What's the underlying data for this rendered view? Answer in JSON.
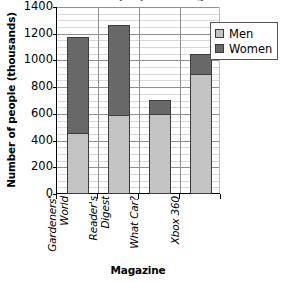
{
  "chart_data": {
    "type": "bar",
    "subtype": "stacked-vertical",
    "title": "Number of people reading magazines",
    "xlabel": "Magazine",
    "ylabel": "Number of people (thousands)",
    "ylim": [
      0,
      1400
    ],
    "ytick_step": 200,
    "yticks": [
      1400,
      1200,
      1000,
      800,
      600,
      400,
      200,
      0
    ],
    "ytick_labels": [
      "1400",
      "1200",
      "1000",
      "800",
      "600",
      "400",
      "200",
      "0"
    ],
    "minor_gridline_step": 50,
    "grid": "horizontal-major-and-minor-plus-vertical-category-separators",
    "legend_position": "right",
    "categories": [
      "Gardeners' World",
      "Reader's Digest",
      "What Car?",
      "Xbox 360"
    ],
    "category_labels_rotated": true,
    "series": [
      {
        "name": "Men",
        "color": "#c3c3c3",
        "values": [
          450,
          585,
          590,
          890
        ]
      },
      {
        "name": "Women",
        "color": "#686868",
        "values": [
          720,
          675,
          110,
          150
        ]
      }
    ],
    "totals": [
      1170,
      1260,
      700,
      1040
    ]
  },
  "legend": {
    "entries": [
      {
        "label": "Men",
        "color": "#c3c3c3"
      },
      {
        "label": "Women",
        "color": "#686868"
      }
    ]
  }
}
